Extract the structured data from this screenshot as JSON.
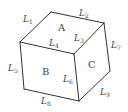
{
  "diagram": {
    "type": "cube",
    "faces": [
      {
        "id": "A",
        "label": "A",
        "x": 58,
        "y": 31
      },
      {
        "id": "B",
        "label": "B",
        "x": 42,
        "y": 75
      },
      {
        "id": "C",
        "label": "C",
        "x": 88,
        "y": 68
      }
    ],
    "edges": [
      {
        "id": "L1",
        "letter": "L",
        "sub": "1",
        "x": 23,
        "y": 22
      },
      {
        "id": "L2",
        "letter": "L",
        "sub": "2",
        "x": 79,
        "y": 16
      },
      {
        "id": "L3",
        "letter": "L",
        "sub": "3",
        "x": 74,
        "y": 41
      },
      {
        "id": "L4",
        "letter": "L",
        "sub": "4",
        "x": 49,
        "y": 46
      },
      {
        "id": "L5",
        "letter": "L",
        "sub": "5",
        "x": 8,
        "y": 71
      },
      {
        "id": "L6",
        "letter": "L",
        "sub": "6",
        "x": 63,
        "y": 82
      },
      {
        "id": "L7",
        "letter": "L",
        "sub": "7",
        "x": 111,
        "y": 48
      },
      {
        "id": "L8",
        "letter": "L",
        "sub": "8",
        "x": 41,
        "y": 104
      },
      {
        "id": "L9",
        "letter": "L",
        "sub": "9",
        "x": 100,
        "y": 95
      }
    ]
  }
}
